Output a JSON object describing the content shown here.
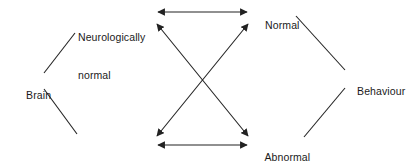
{
  "diagram": {
    "background_color": "#ffffff",
    "line_color": "#222222",
    "text_color": "#1a1a1a",
    "nodes": [
      {
        "id": "brain",
        "label": "Brain",
        "lines": [
          "Brain"
        ],
        "x": 14,
        "y": 76
      },
      {
        "id": "neurologically-normal",
        "label": "Neurologically normal",
        "lines": [
          "Neurologically",
          "normal"
        ],
        "x": 78,
        "y": 6
      },
      {
        "id": "neurologically-abnormal",
        "label": "Neurologically abnormal",
        "lines": [
          "Neurologically",
          "abnormal"
        ],
        "x": 78,
        "y": 138
      },
      {
        "id": "normal",
        "label": "Normal",
        "lines": [
          "Normal"
        ],
        "x": 253,
        "y": 6
      },
      {
        "id": "abnormal",
        "label": "Abnormal",
        "lines": [
          "Abnormal"
        ],
        "x": 253,
        "y": 138
      },
      {
        "id": "behaviour",
        "label": "Behaviour",
        "lines": [
          "Behaviour"
        ],
        "x": 345,
        "y": 72
      }
    ],
    "edges": [
      {
        "id": "brain-to-neurologically-normal",
        "from": "brain",
        "to": "neurologically-normal",
        "style": "plain",
        "arrows": "none"
      },
      {
        "id": "brain-to-neurologically-abnormal",
        "from": "brain",
        "to": "neurologically-abnormal",
        "style": "plain",
        "arrows": "none"
      },
      {
        "id": "normal-to-behaviour",
        "from": "normal",
        "to": "behaviour",
        "style": "plain",
        "arrows": "none"
      },
      {
        "id": "abnormal-to-behaviour",
        "from": "abnormal",
        "to": "behaviour",
        "style": "plain",
        "arrows": "none"
      },
      {
        "id": "neuro-normal-to-normal",
        "from": "neurologically-normal",
        "to": "normal",
        "style": "arrow",
        "arrows": "both"
      },
      {
        "id": "neuro-abnormal-to-abnormal",
        "from": "neurologically-abnormal",
        "to": "abnormal",
        "style": "arrow",
        "arrows": "both"
      },
      {
        "id": "neuro-normal-to-abnormal",
        "from": "neurologically-normal",
        "to": "abnormal",
        "style": "arrow",
        "arrows": "both"
      },
      {
        "id": "neuro-abnormal-to-normal",
        "from": "neurologically-abnormal",
        "to": "normal",
        "style": "arrow",
        "arrows": "both"
      }
    ]
  }
}
